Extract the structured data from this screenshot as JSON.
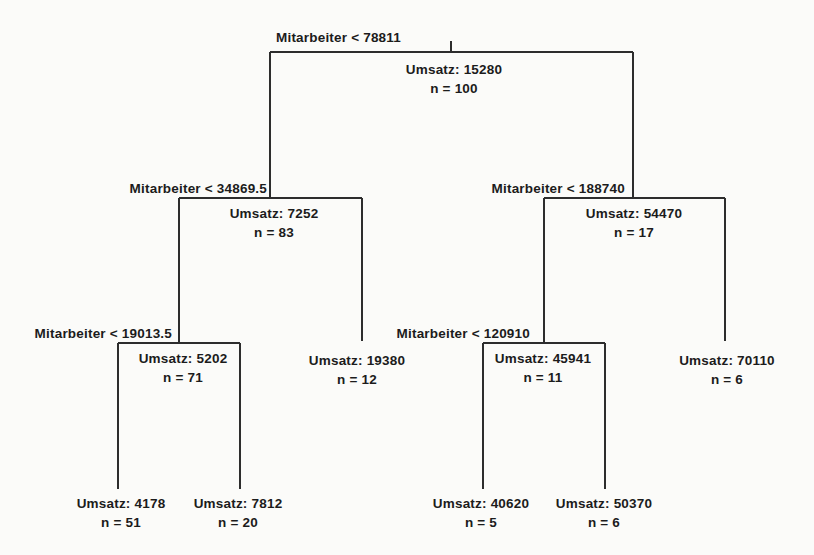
{
  "figure": {
    "type": "regression-tree",
    "background": "#fbfbf9",
    "line_color": "#2d2d2d",
    "text_color": "#1c1c1c"
  },
  "nodes": {
    "root": {
      "split": "Mitarbeiter < 78811",
      "value": "Umsatz: 15280",
      "count": "n = 100"
    },
    "left": {
      "split": "Mitarbeiter < 34869.5",
      "value": "Umsatz: 7252",
      "count": "n = 83"
    },
    "right": {
      "split": "Mitarbeiter < 188740",
      "value": "Umsatz: 54470",
      "count": "n = 17"
    },
    "left_left": {
      "split": "Mitarbeiter < 19013.5",
      "value": "Umsatz: 5202",
      "count": "n = 71"
    },
    "left_right": {
      "value": "Umsatz: 19380",
      "count": "n = 12"
    },
    "right_left": {
      "split": "Mitarbeiter < 120910",
      "value": "Umsatz: 45941",
      "count": "n = 11"
    },
    "right_right": {
      "value": "Umsatz: 70110",
      "count": "n = 6"
    },
    "left_left_left": {
      "value": "Umsatz: 4178",
      "count": "n = 51"
    },
    "left_left_right": {
      "value": "Umsatz: 7812",
      "count": "n = 20"
    },
    "right_left_left": {
      "value": "Umsatz: 40620",
      "count": "n = 5"
    },
    "right_left_right": {
      "value": "Umsatz: 50370",
      "count": "n = 6"
    }
  }
}
